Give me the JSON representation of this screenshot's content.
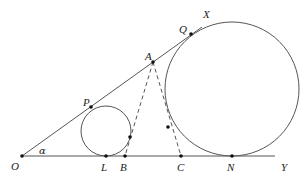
{
  "figure": {
    "colors": {
      "stroke": "#555555",
      "point": "#111111",
      "label": "#222222",
      "background": "#ffffff"
    },
    "labels": {
      "O": "O",
      "L": "L",
      "B": "B",
      "C": "C",
      "N": "N",
      "Y": "Y",
      "X": "X",
      "Q": "Q",
      "A": "A",
      "P": "P",
      "alpha": "α"
    },
    "points": {
      "O": [
        22,
        156
      ],
      "L": [
        106,
        156
      ],
      "B": [
        125,
        156
      ],
      "C": [
        181,
        156
      ],
      "N": [
        232,
        156
      ],
      "A": [
        153,
        62
      ],
      "Q": [
        191,
        34
      ],
      "P": [
        91,
        107
      ],
      "T_small": [
        130,
        137
      ],
      "T_big": [
        168,
        127
      ]
    },
    "circles": [
      {
        "name": "small-circle",
        "center": [
          106,
          131
        ],
        "r": 25
      },
      {
        "name": "large-circle",
        "center": [
          232,
          89
        ],
        "r": 67
      }
    ],
    "rays": {
      "OX": {
        "from": [
          22,
          156
        ],
        "to": [
          202,
          27
        ]
      },
      "OY": {
        "from": [
          22,
          156
        ],
        "to": [
          275,
          156
        ]
      }
    },
    "dashed_segments": [
      {
        "name": "AB",
        "from": [
          153,
          62
        ],
        "to": [
          125,
          156
        ]
      },
      {
        "name": "AC",
        "from": [
          153,
          62
        ],
        "to": [
          181,
          156
        ]
      }
    ]
  }
}
